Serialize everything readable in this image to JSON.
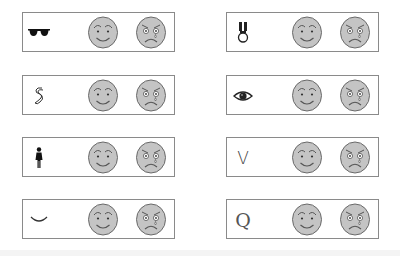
{
  "figure": {
    "face_fill": "#c4c4c4",
    "face_stroke": "#6a6a6a",
    "border_color": "#8a8a8a"
  },
  "panels": [
    {
      "id": "sunglasses",
      "symbol": "sunglasses-icon",
      "column": "left",
      "row": 1
    },
    {
      "id": "medal",
      "symbol": "medal-icon",
      "column": "right",
      "row": 1
    },
    {
      "id": "squiggle",
      "symbol": "squiggle-s-icon",
      "column": "left",
      "row": 2
    },
    {
      "id": "eye",
      "symbol": "eye-icon",
      "column": "right",
      "row": 2
    },
    {
      "id": "woman",
      "symbol": "woman-figure-icon",
      "column": "left",
      "row": 3
    },
    {
      "id": "v",
      "symbol": "letter-v",
      "text": "V",
      "column": "right",
      "row": 3
    },
    {
      "id": "smile-curve",
      "symbol": "smile-curve-icon",
      "column": "left",
      "row": 4
    },
    {
      "id": "q",
      "symbol": "letter-q",
      "text": "Q",
      "column": "right",
      "row": 4
    }
  ],
  "faces": {
    "happy": "happy-face",
    "sad": "sad-crying-face"
  }
}
